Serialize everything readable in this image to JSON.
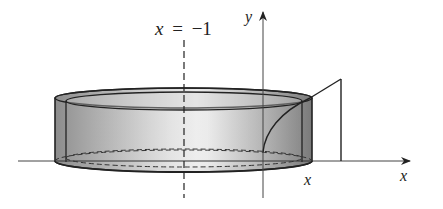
{
  "diagram": {
    "labels": {
      "axis_line_var": "x",
      "axis_line_eq": "=",
      "axis_line_val": "−1",
      "y_axis": "y",
      "x_axis": "x",
      "shell_radius_x": "x"
    },
    "colors": {
      "stroke": "#222222",
      "shell_dark": "#8a8a8a",
      "shell_light": "#e6e6e6",
      "background": "#ffffff"
    }
  }
}
